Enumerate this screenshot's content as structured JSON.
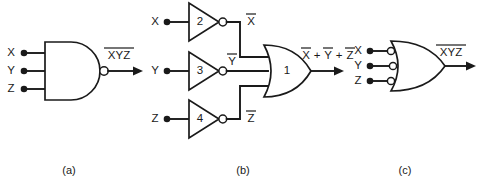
{
  "figure": {
    "background_color": "#ffffff",
    "line_color": "#1a1a1a"
  },
  "panels": [
    {
      "caption": "(a)",
      "gate_type": "nand",
      "inputs": [
        {
          "label": "X"
        },
        {
          "label": "Y"
        },
        {
          "label": "Z"
        }
      ],
      "output": {
        "expression": "XYZ",
        "overbar": true
      }
    },
    {
      "caption": "(b)",
      "gate_type": "inverters-into-or",
      "inputs": [
        {
          "label": "X"
        },
        {
          "label": "Y"
        },
        {
          "label": "Z"
        }
      ],
      "inverters": [
        {
          "number": "2",
          "output_label": "X",
          "output_overbar": true
        },
        {
          "number": "3",
          "output_label": "Y",
          "output_overbar": true
        },
        {
          "number": "4",
          "output_label": "Z",
          "output_overbar": true
        }
      ],
      "or_gate": {
        "number": "1"
      },
      "output": {
        "terms": [
          {
            "label": "X",
            "overbar": true
          },
          {
            "label": "Y",
            "overbar": true
          },
          {
            "label": "Z",
            "overbar": true
          }
        ],
        "operator": "+"
      }
    },
    {
      "caption": "(c)",
      "gate_type": "or-with-inverted-inputs",
      "inputs": [
        {
          "label": "X",
          "inverted": true
        },
        {
          "label": "Y",
          "inverted": true
        },
        {
          "label": "Z",
          "inverted": true
        }
      ],
      "output": {
        "expression": "XYZ",
        "overbar": true
      }
    }
  ]
}
